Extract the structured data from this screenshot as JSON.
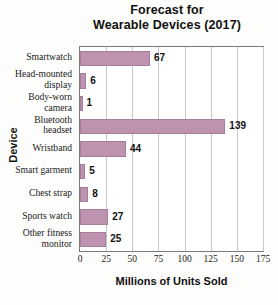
{
  "chart_data": {
    "type": "bar",
    "orientation": "horizontal",
    "title": "Forecast for Wearable Devices (2017)",
    "title_line1": "Forecast for",
    "title_line2": "Wearable Devices (2017)",
    "xlabel": "Millions of Units Sold",
    "ylabel": "Device",
    "categories": [
      "Smartwatch",
      "Head-mounted display",
      "Body-worn camera",
      "Bluetooth headset",
      "Wristband",
      "Smart garment",
      "Chest strap",
      "Sports watch",
      "Other fitness monitor"
    ],
    "category_lines": [
      [
        "Smartwatch"
      ],
      [
        "Head-mounted",
        "display"
      ],
      [
        "Body-worn",
        "camera"
      ],
      [
        "Bluetooth",
        "headset"
      ],
      [
        "Wristband"
      ],
      [
        "Smart garment"
      ],
      [
        "Chest strap"
      ],
      [
        "Sports watch"
      ],
      [
        "Other fitness",
        "monitor"
      ]
    ],
    "values": [
      67,
      6,
      1,
      139,
      44,
      5,
      8,
      27,
      25
    ],
    "value_labels": [
      "67",
      "6",
      "1",
      "139",
      "44",
      "5",
      "8",
      "27",
      "25"
    ],
    "xlim": [
      0,
      175
    ],
    "xticks": [
      0,
      25,
      50,
      75,
      100,
      125,
      150,
      175
    ],
    "xtick_labels": [
      "0",
      "25",
      "50",
      "75",
      "100",
      "125",
      "150",
      "175"
    ],
    "grid": "vertical",
    "legend": "none",
    "bar_color": "#bd93b0",
    "bar_edge_color": "#a87c9c",
    "gridline_color": "#c9c9c9",
    "frame_color": "#7a7a7a",
    "background": "#ffffff"
  }
}
